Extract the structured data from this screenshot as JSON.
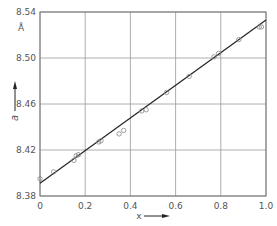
{
  "chart_data": {
    "type": "scatter",
    "title": "",
    "xlabel": "x",
    "ylabel": "a",
    "yunit": "Å",
    "xlim": [
      0,
      1.0
    ],
    "ylim": [
      8.38,
      8.54
    ],
    "xticks": [
      "0",
      "0.2",
      "0.4",
      "0.6",
      "0.8",
      "1.0"
    ],
    "yticks": [
      "8.38",
      "8.42",
      "8.46",
      "8.50",
      "8.54"
    ],
    "grid": true,
    "legend": null,
    "series": [
      {
        "name": "measured",
        "marker": "open-circle",
        "x": [
          0.0,
          0.06,
          0.15,
          0.16,
          0.17,
          0.26,
          0.27,
          0.35,
          0.37,
          0.45,
          0.47,
          0.56,
          0.66,
          0.77,
          0.79,
          0.88,
          0.97,
          0.98
        ],
        "y": [
          8.395,
          8.401,
          8.411,
          8.415,
          8.416,
          8.427,
          8.428,
          8.434,
          8.437,
          8.454,
          8.455,
          8.47,
          8.484,
          8.501,
          8.504,
          8.516,
          8.527,
          8.527
        ]
      },
      {
        "name": "linear fit",
        "type": "line",
        "x": [
          0.0,
          1.0
        ],
        "y": [
          8.391,
          8.533
        ]
      }
    ]
  }
}
